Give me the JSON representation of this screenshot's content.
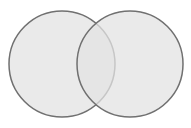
{
  "diagram": {
    "type": "venn",
    "sets": [
      {
        "id": "left",
        "cx": 62,
        "cy": 64,
        "r": 53
      },
      {
        "id": "right",
        "cx": 130,
        "cy": 64,
        "r": 53
      }
    ],
    "colors": {
      "background": "#ffffff",
      "fill": "#e3e3e3",
      "stroke": "#707070"
    }
  }
}
